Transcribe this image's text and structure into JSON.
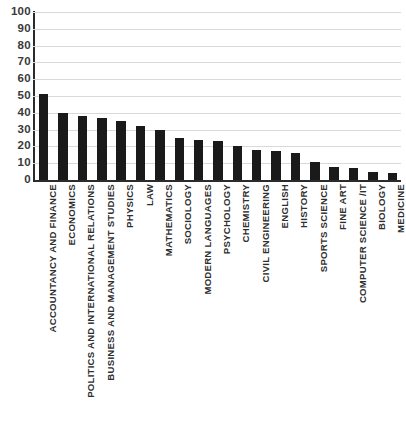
{
  "chart_data": {
    "type": "bar",
    "title": "",
    "xlabel": "",
    "ylabel": "",
    "ylim": [
      0,
      100
    ],
    "grid": true,
    "legend": "none",
    "orientation": "vertical",
    "bar_color": "#1a1a1a",
    "categories": [
      "ACCOUNTANCY AND FINANCE",
      "ECONOMICS",
      "POLITICS AND INTERNATIONAL RELATIONS",
      "BUSINESS AND MANAGEMENT STUDIES",
      "PHYSICS",
      "LAW",
      "MATHEMATICS",
      "SOCIOLOGY",
      "MODERN LANGUAGES",
      "PSYCHOLOGY",
      "CHEMISTRY",
      "CIVIL ENGINEERING",
      "ENGLISH",
      "HISTORY",
      "SPORTS SCIENCE",
      "FINE ART",
      "COMPUTER SCIENCE /IT",
      "BIOLOGY",
      "MEDICINE"
    ],
    "values": [
      51,
      40,
      38,
      37,
      35,
      32,
      30,
      25,
      24,
      23,
      20,
      18,
      17,
      16,
      11,
      8,
      7,
      5,
      4
    ],
    "y_ticks": [
      0,
      10,
      20,
      30,
      40,
      50,
      60,
      70,
      80,
      90,
      100
    ],
    "y_tick_labels": [
      "0",
      "10",
      "20",
      "30",
      "40",
      "50",
      "60",
      "70",
      "80",
      "90",
      "100"
    ]
  }
}
